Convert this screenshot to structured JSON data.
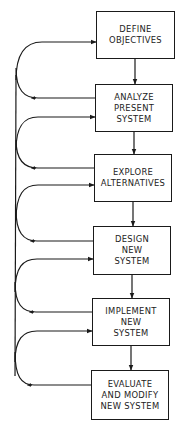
{
  "diagram": {
    "type": "flowchart-with-feedback",
    "steps": [
      {
        "id": "define",
        "lines": [
          "DEFINE",
          "OBJECTIVES"
        ]
      },
      {
        "id": "analyze",
        "lines": [
          "ANALYZE",
          "PRESENT",
          "SYSTEM"
        ]
      },
      {
        "id": "explore",
        "lines": [
          "EXPLORE",
          "ALTERNATIVES"
        ]
      },
      {
        "id": "design",
        "lines": [
          "DESIGN",
          "NEW",
          "SYSTEM"
        ]
      },
      {
        "id": "implement",
        "lines": [
          "IMPLEMENT",
          "NEW",
          "SYSTEM"
        ]
      },
      {
        "id": "evaluate",
        "lines": [
          "EVALUATE",
          "AND MODIFY",
          "NEW SYSTEM"
        ]
      }
    ],
    "colors": {
      "line": "#1a1a1a",
      "background": "#ffffff"
    }
  }
}
